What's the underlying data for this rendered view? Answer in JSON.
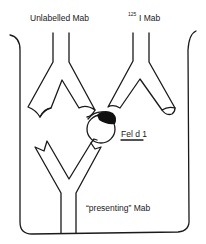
{
  "diagram": {
    "type": "immunoassay-schematic",
    "labels": {
      "unlabelled_mab": "Unlabelled Mab",
      "iodine_mass": "125",
      "iodine_mab": "I Mab",
      "antigen": "Fel d 1",
      "presenting_mab": "“presenting” Mab"
    },
    "colors": {
      "line": "#1a1a1a",
      "background": "#ffffff",
      "label_fill": "#1a1a1a"
    },
    "elements": [
      {
        "id": "well",
        "description": "microtiter well outline"
      },
      {
        "id": "unlabelled-mab",
        "description": "inverted Y antibody, top left"
      },
      {
        "id": "iodinated-mab",
        "description": "inverted Y antibody with radiolabel, top right"
      },
      {
        "id": "fel-d-1-antigen",
        "description": "circle antigen with black binding epitope"
      },
      {
        "id": "presenting-mab",
        "description": "upright Y antibody at well bottom"
      }
    ]
  }
}
